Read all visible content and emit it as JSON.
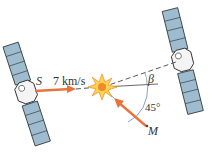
{
  "diagram": {
    "labels": {
      "satellite_s": "S",
      "velocity": "7 km/s",
      "angle_beta": "β",
      "angle_45": "45°",
      "point_m": "M"
    },
    "colors": {
      "arrow": "#e8743b",
      "panel_blue": "#9dbcd0",
      "panel_light": "#d5e3ec",
      "line": "#444444",
      "arc": "#5b8fc7",
      "burst_yellow": "#ffd34d",
      "burst_orange": "#f08a2c"
    }
  }
}
